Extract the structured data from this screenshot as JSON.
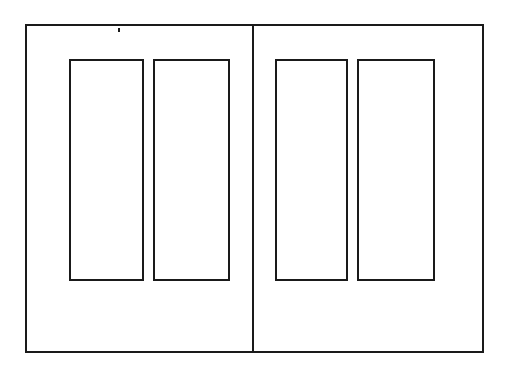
{
  "figure": {
    "type": "technical-line-drawing",
    "background_color": "#ffffff",
    "line_color": "#1a1a1a",
    "canvas": {
      "width": 512,
      "height": 369
    }
  },
  "outer_frame": {
    "name": "Outer frame",
    "x": 26,
    "y": 25,
    "width": 457,
    "height": 327,
    "stroke_width": 2.4
  },
  "center_divider": {
    "name": "Center vertical divider",
    "x": 253,
    "y_top": 25,
    "y_bottom": 352,
    "stroke_width": 2.4
  },
  "panels": [
    {
      "name": "Left leaf",
      "rects": [
        {
          "label": "Upper left panel",
          "x": 70,
          "y": 60,
          "width": 73,
          "height": 220,
          "stroke_width": 2.0
        },
        {
          "label": "Upper mid-left panel",
          "x": 154,
          "y": 60,
          "width": 75,
          "height": 220,
          "stroke_width": 2.0
        }
      ]
    },
    {
      "name": "Right leaf",
      "rects": [
        {
          "label": "Upper mid-right panel",
          "x": 276,
          "y": 60,
          "width": 71,
          "height": 220,
          "stroke_width": 2.0
        },
        {
          "label": "Upper right panel",
          "x": 358,
          "y": 60,
          "width": 76,
          "height": 220,
          "stroke_width": 2.0
        }
      ]
    }
  ],
  "marks": [
    {
      "label": "Stray tick mark near top rail",
      "x": 118,
      "y": 28,
      "width": 1.6,
      "height": 4
    }
  ],
  "accessibility": {
    "figure_caption": "Two-leaf panelled door elevation with four recessed rectangular panels",
    "left_leaf_label": "Left leaf",
    "right_leaf_label": "Right leaf"
  }
}
